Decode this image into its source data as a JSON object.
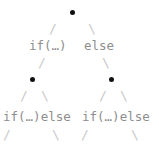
{
  "diagram": {
    "type": "binary-tree",
    "colors": {
      "background": "#ffffff",
      "node": "#111111",
      "edge": "#c9c9c9",
      "label": "#8e8e8e"
    },
    "nodes": [
      {
        "id": "root",
        "x": 72,
        "y": 12,
        "level": 0
      },
      {
        "id": "left",
        "x": 32,
        "y": 79,
        "level": 1
      },
      {
        "id": "right",
        "x": 111,
        "y": 79,
        "level": 1
      }
    ],
    "edges": [
      {
        "id": "root-left",
        "glyph": "/",
        "x": 49,
        "y": 22
      },
      {
        "id": "root-right",
        "glyph": "\\",
        "x": 88,
        "y": 22
      },
      {
        "id": "lvl1-left",
        "glyph": "/",
        "x": 38,
        "y": 56
      },
      {
        "id": "lvl1-right",
        "glyph": "\\",
        "x": 102,
        "y": 56
      },
      {
        "id": "left-a",
        "glyph": "/",
        "x": 20,
        "y": 89
      },
      {
        "id": "left-b",
        "glyph": "\\",
        "x": 41,
        "y": 89
      },
      {
        "id": "right-a",
        "glyph": "/",
        "x": 99,
        "y": 89
      },
      {
        "id": "right-b",
        "glyph": "\\",
        "x": 120,
        "y": 89
      },
      {
        "id": "leaf-1",
        "glyph": "/",
        "x": 3,
        "y": 128
      },
      {
        "id": "leaf-2",
        "glyph": "\\",
        "x": 52,
        "y": 128
      },
      {
        "id": "leaf-3",
        "glyph": "/",
        "x": 81,
        "y": 128
      },
      {
        "id": "leaf-4",
        "glyph": "\\",
        "x": 131,
        "y": 128
      }
    ],
    "labels": [
      {
        "id": "lvl1-if",
        "text": "if(…)",
        "x": 29,
        "y": 39,
        "level": 1
      },
      {
        "id": "lvl1-else",
        "text": "else",
        "x": 84,
        "y": 39,
        "level": 1
      },
      {
        "id": "lvl2-left",
        "text": "if(…)else",
        "x": 3,
        "y": 110,
        "level": 2
      },
      {
        "id": "lvl2-right",
        "text": "if(…)else",
        "x": 82,
        "y": 110,
        "level": 2
      }
    ]
  }
}
